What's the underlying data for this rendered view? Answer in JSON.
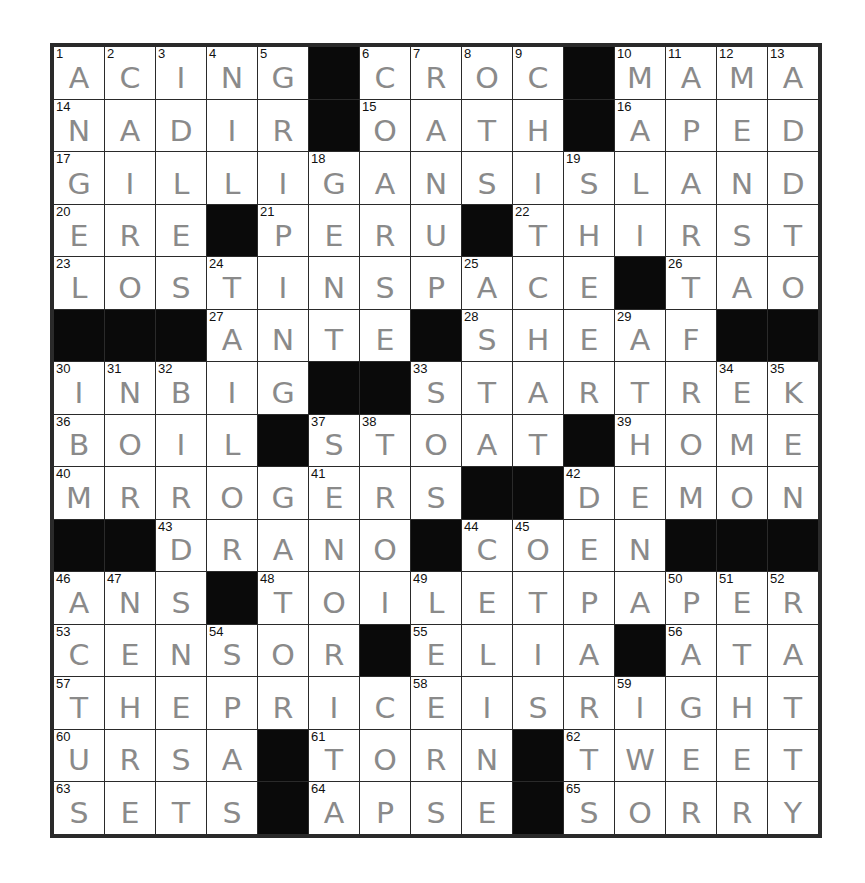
{
  "puzzle": {
    "size": 15,
    "ink_color": "#8a8a8a",
    "grid_line_color": "#2a2a2a",
    "block_color": "#0a0a0a",
    "rows": [
      "ACING#CROC#MAMA",
      "NADIR#OATH#APED",
      "GILLIGANSISLAND",
      "ERE#PERU#THIRST",
      "LOSTINSPACE#TAO",
      "###ANTE#SHEAF##",
      "INBIG##STARTREK",
      "BOIL#STOAT#HOME",
      "MRROGERS##DEMON",
      "##DRANO#COEN###",
      "ANS#TOILETPAPER",
      "CENSOR#ELIA#ATA",
      "THEPRICEISRIGHT",
      "URSA#TORN#TWEET",
      "SETS#APSE#SORRY"
    ],
    "numbers": [
      [
        1,
        2,
        3,
        4,
        5,
        0,
        6,
        7,
        8,
        9,
        0,
        10,
        11,
        12,
        13
      ],
      [
        14,
        0,
        0,
        0,
        0,
        0,
        15,
        0,
        0,
        0,
        0,
        16,
        0,
        0,
        0
      ],
      [
        17,
        0,
        0,
        0,
        0,
        18,
        0,
        0,
        0,
        0,
        19,
        0,
        0,
        0,
        0
      ],
      [
        20,
        0,
        0,
        0,
        21,
        0,
        0,
        0,
        0,
        22,
        0,
        0,
        0,
        0,
        0
      ],
      [
        23,
        0,
        0,
        24,
        0,
        0,
        0,
        0,
        25,
        0,
        0,
        0,
        26,
        0,
        0
      ],
      [
        0,
        0,
        0,
        27,
        0,
        0,
        0,
        0,
        28,
        0,
        0,
        29,
        0,
        0,
        0
      ],
      [
        30,
        31,
        32,
        0,
        0,
        0,
        0,
        33,
        0,
        0,
        0,
        0,
        0,
        34,
        35
      ],
      [
        36,
        0,
        0,
        0,
        0,
        37,
        38,
        0,
        0,
        0,
        0,
        39,
        0,
        0,
        0
      ],
      [
        40,
        0,
        0,
        0,
        0,
        41,
        0,
        0,
        0,
        0,
        42,
        0,
        0,
        0,
        0
      ],
      [
        0,
        0,
        43,
        0,
        0,
        0,
        0,
        0,
        44,
        45,
        0,
        0,
        0,
        0,
        0
      ],
      [
        46,
        47,
        0,
        0,
        48,
        0,
        0,
        49,
        0,
        0,
        0,
        0,
        50,
        51,
        52
      ],
      [
        53,
        0,
        0,
        54,
        0,
        0,
        0,
        55,
        0,
        0,
        0,
        0,
        56,
        0,
        0
      ],
      [
        57,
        0,
        0,
        0,
        0,
        0,
        0,
        58,
        0,
        0,
        0,
        59,
        0,
        0,
        0
      ],
      [
        60,
        0,
        0,
        0,
        0,
        61,
        0,
        0,
        0,
        0,
        62,
        0,
        0,
        0,
        0
      ],
      [
        63,
        0,
        0,
        0,
        0,
        64,
        0,
        0,
        0,
        0,
        65,
        0,
        0,
        0,
        0
      ]
    ]
  }
}
